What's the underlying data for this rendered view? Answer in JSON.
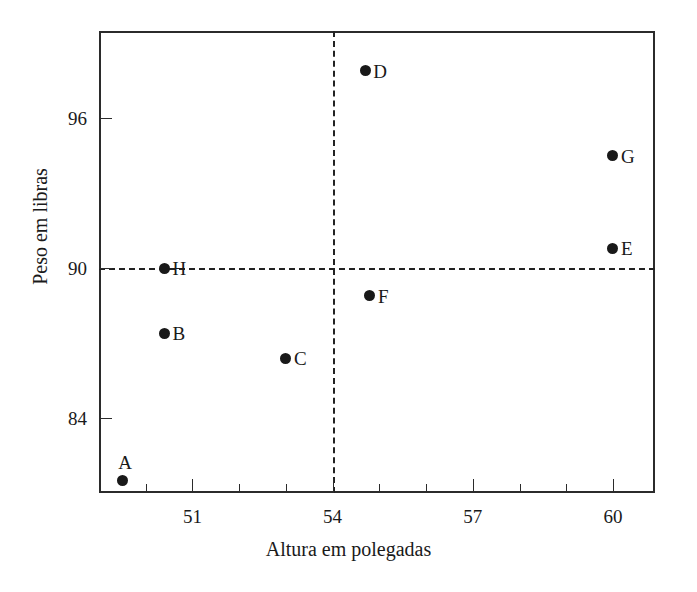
{
  "chart_data": {
    "type": "scatter",
    "title": "",
    "xlabel": "Altura em polegadas",
    "ylabel": "Peso em libras",
    "xlim": [
      49.0,
      60.9
    ],
    "ylim": [
      81.0,
      99.5
    ],
    "xticks": [
      51,
      54,
      57,
      60
    ],
    "xtick_labels": [
      "51",
      "54",
      "57",
      "60"
    ],
    "xminor_ticks": [
      50,
      52,
      53,
      55,
      56,
      58,
      59
    ],
    "yticks": [
      84,
      90,
      96
    ],
    "ytick_labels": [
      "84",
      "90",
      "96"
    ],
    "grid": false,
    "legend": null,
    "reference_lines": [
      {
        "name": "mean-weight-line",
        "orientation": "horizontal",
        "value": 90,
        "style": "dashed"
      },
      {
        "name": "mean-height-line",
        "orientation": "vertical",
        "value": 54,
        "style": "dashed"
      }
    ],
    "points": [
      {
        "label": "A",
        "x": 49.5,
        "y": 81.5,
        "label_position": "above"
      },
      {
        "label": "B",
        "x": 50.4,
        "y": 87.4,
        "label_position": "right"
      },
      {
        "label": "C",
        "x": 53.0,
        "y": 86.4,
        "label_position": "right"
      },
      {
        "label": "D",
        "x": 54.7,
        "y": 97.9,
        "label_position": "right"
      },
      {
        "label": "E",
        "x": 60.0,
        "y": 90.8,
        "label_position": "right"
      },
      {
        "label": "F",
        "x": 54.8,
        "y": 88.9,
        "label_position": "right"
      },
      {
        "label": "G",
        "x": 60.0,
        "y": 94.5,
        "label_position": "right"
      },
      {
        "label": "H",
        "x": 50.4,
        "y": 90.0,
        "label_position": "right"
      }
    ],
    "colors": {
      "point": "#191919",
      "axis": "#2b2b2b",
      "reference_line": "#222222",
      "background": "#ffffff"
    }
  }
}
